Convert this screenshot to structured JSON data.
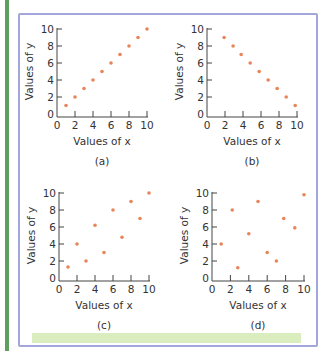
{
  "colors": {
    "point": "#e8855a",
    "axis": "#444444",
    "frame": "#a3a6dc",
    "green_rule": "#5e9f5e",
    "footer_bar": "#daedbe"
  },
  "chart_data": [
    {
      "type": "scatter",
      "caption": "(a)",
      "xlabel": "Values of x",
      "ylabel": "Values of y",
      "xlim": [
        0,
        10
      ],
      "ylim": [
        0,
        10
      ],
      "xticks": [
        0,
        2,
        4,
        6,
        8,
        10
      ],
      "yticks": [
        0,
        2,
        4,
        6,
        8,
        10
      ],
      "grid": false,
      "points": [
        [
          1,
          1
        ],
        [
          2,
          2
        ],
        [
          3,
          3
        ],
        [
          4,
          4
        ],
        [
          5,
          5
        ],
        [
          6,
          6
        ],
        [
          7,
          7
        ],
        [
          8,
          8
        ],
        [
          9,
          9
        ],
        [
          10,
          10
        ]
      ]
    },
    {
      "type": "scatter",
      "caption": "(b)",
      "xlabel": "Values of x",
      "ylabel": "Values of y",
      "xlim": [
        0,
        10
      ],
      "ylim": [
        0,
        10
      ],
      "xticks": [
        0,
        2,
        4,
        6,
        8,
        10
      ],
      "yticks": [
        0,
        2,
        4,
        6,
        8,
        10
      ],
      "grid": false,
      "points": [
        [
          1.9,
          9
        ],
        [
          2.9,
          8
        ],
        [
          3.8,
          7
        ],
        [
          4.8,
          6
        ],
        [
          5.8,
          5
        ],
        [
          6.8,
          4
        ],
        [
          7.8,
          3
        ],
        [
          8.8,
          2
        ],
        [
          9.8,
          1
        ]
      ]
    },
    {
      "type": "scatter",
      "caption": "(c)",
      "xlabel": "Values of x",
      "ylabel": "Values of y",
      "xlim": [
        0,
        10
      ],
      "ylim": [
        0,
        10
      ],
      "xticks": [
        0,
        2,
        4,
        6,
        8,
        10
      ],
      "yticks": [
        0,
        2,
        4,
        6,
        8,
        10
      ],
      "grid": false,
      "points": [
        [
          1,
          1.3
        ],
        [
          2,
          4
        ],
        [
          3,
          2
        ],
        [
          4,
          6.2
        ],
        [
          5,
          3
        ],
        [
          6,
          8
        ],
        [
          7,
          4.8
        ],
        [
          8,
          9
        ],
        [
          9,
          7
        ],
        [
          10,
          10
        ]
      ]
    },
    {
      "type": "scatter",
      "caption": "(d)",
      "xlabel": "Values of x",
      "ylabel": "Values of y",
      "xlim": [
        0,
        10
      ],
      "ylim": [
        0,
        10
      ],
      "xticks": [
        0,
        2,
        4,
        6,
        8,
        10
      ],
      "yticks": [
        0,
        2,
        4,
        6,
        8,
        10
      ],
      "grid": false,
      "points": [
        [
          1,
          4
        ],
        [
          2.2,
          8
        ],
        [
          2.8,
          1.2
        ],
        [
          4,
          5.2
        ],
        [
          5,
          9
        ],
        [
          6,
          3
        ],
        [
          7,
          2
        ],
        [
          7.8,
          7
        ],
        [
          9,
          5.9
        ],
        [
          10,
          9.8
        ]
      ]
    }
  ],
  "layout": [
    {
      "ox": 57,
      "oy": 114,
      "sx": 9.0,
      "sy": 8.5
    },
    {
      "ox": 207,
      "oy": 114,
      "sx": 9.0,
      "sy": 8.5
    },
    {
      "ox": 59,
      "oy": 278,
      "sx": 9.0,
      "sy": 8.5
    },
    {
      "ox": 212,
      "oy": 278,
      "sx": 9.2,
      "sy": 8.5
    }
  ]
}
